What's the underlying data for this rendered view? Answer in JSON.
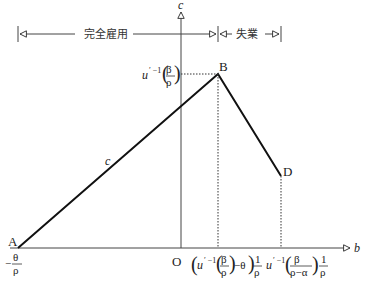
{
  "diagram": {
    "axes": {
      "x_label": "b",
      "y_label": "c",
      "origin_label": "O"
    },
    "regions": [
      {
        "label": "完全雇用"
      },
      {
        "label": "失業"
      }
    ],
    "points": {
      "A": {
        "label": "A",
        "x_label_num": "θ",
        "x_label_den": "ρ",
        "x_label_sign": "−"
      },
      "B": {
        "label": "B"
      },
      "D": {
        "label": "D"
      }
    },
    "curve_label": "c",
    "y_tick": {
      "text_u": "u",
      "text_sup": "′ −1",
      "num": "β",
      "den": "ρ"
    },
    "x_ticks": [
      {
        "u": "u",
        "sup": "′ −1",
        "num": "β",
        "den": "ρ",
        "minus": "−θ",
        "one": "1",
        "rho": "ρ"
      },
      {
        "u": "u",
        "sup": "′ −1",
        "num": "β",
        "den": "ρ−α",
        "one": "1",
        "rho": "ρ"
      }
    ]
  }
}
